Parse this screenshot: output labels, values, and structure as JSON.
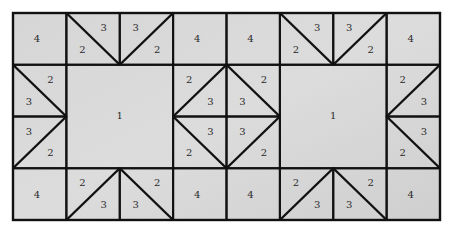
{
  "diagram": {
    "type": "quilt-block-pattern",
    "grid": {
      "columns": 8,
      "rows": 4
    },
    "colors": {
      "fabric": "#d3d3d3",
      "fabric_light": "#dedede",
      "line": "#111111",
      "background": "#ffffff"
    },
    "piece_labels": {
      "large_square": "1",
      "triangle_a": "2",
      "triangle_b": "3",
      "small_square": "4"
    },
    "cells": [
      {
        "row": 0,
        "col": 0,
        "type": "square",
        "labels": [
          {
            "text": "4",
            "pos": "c"
          }
        ]
      },
      {
        "row": 0,
        "col": 1,
        "type": "diag",
        "diag": "tl-br",
        "labels": [
          {
            "text": "3",
            "pos": "tr"
          },
          {
            "text": "2",
            "pos": "bl"
          }
        ]
      },
      {
        "row": 0,
        "col": 2,
        "type": "diag",
        "diag": "bl-tr",
        "labels": [
          {
            "text": "3",
            "pos": "tl"
          },
          {
            "text": "2",
            "pos": "br"
          }
        ]
      },
      {
        "row": 0,
        "col": 3,
        "type": "square",
        "labels": [
          {
            "text": "4",
            "pos": "c"
          }
        ]
      },
      {
        "row": 0,
        "col": 4,
        "type": "square",
        "labels": [
          {
            "text": "4",
            "pos": "c"
          }
        ]
      },
      {
        "row": 0,
        "col": 5,
        "type": "diag",
        "diag": "tl-br",
        "labels": [
          {
            "text": "3",
            "pos": "tr"
          },
          {
            "text": "2",
            "pos": "bl"
          }
        ]
      },
      {
        "row": 0,
        "col": 6,
        "type": "diag",
        "diag": "bl-tr",
        "labels": [
          {
            "text": "3",
            "pos": "tl"
          },
          {
            "text": "2",
            "pos": "br"
          }
        ]
      },
      {
        "row": 0,
        "col": 7,
        "type": "square",
        "labels": [
          {
            "text": "4",
            "pos": "c"
          }
        ]
      },
      {
        "row": 1,
        "col": 0,
        "type": "diag",
        "diag": "tl-br",
        "labels": [
          {
            "text": "2",
            "pos": "tr"
          },
          {
            "text": "3",
            "pos": "bl"
          }
        ]
      },
      {
        "row": 1,
        "col": 3,
        "type": "diag",
        "diag": "bl-tr",
        "labels": [
          {
            "text": "2",
            "pos": "tl"
          },
          {
            "text": "3",
            "pos": "br"
          }
        ]
      },
      {
        "row": 1,
        "col": 4,
        "type": "diag",
        "diag": "tl-br",
        "labels": [
          {
            "text": "3",
            "pos": "bl"
          },
          {
            "text": "2",
            "pos": "tr"
          }
        ]
      },
      {
        "row": 1,
        "col": 7,
        "type": "diag",
        "diag": "bl-tr",
        "labels": [
          {
            "text": "2",
            "pos": "tl"
          },
          {
            "text": "3",
            "pos": "br"
          }
        ]
      },
      {
        "row": 2,
        "col": 0,
        "type": "diag",
        "diag": "bl-tr",
        "labels": [
          {
            "text": "3",
            "pos": "tl"
          },
          {
            "text": "2",
            "pos": "br"
          }
        ]
      },
      {
        "row": 2,
        "col": 3,
        "type": "diag",
        "diag": "tl-br",
        "labels": [
          {
            "text": "3",
            "pos": "tr"
          },
          {
            "text": "2",
            "pos": "bl"
          }
        ]
      },
      {
        "row": 2,
        "col": 4,
        "type": "diag",
        "diag": "bl-tr",
        "labels": [
          {
            "text": "3",
            "pos": "tl"
          },
          {
            "text": "2",
            "pos": "br"
          }
        ]
      },
      {
        "row": 2,
        "col": 7,
        "type": "diag",
        "diag": "tl-br",
        "labels": [
          {
            "text": "3",
            "pos": "tr"
          },
          {
            "text": "2",
            "pos": "bl"
          }
        ]
      },
      {
        "row": 3,
        "col": 0,
        "type": "square",
        "labels": [
          {
            "text": "4",
            "pos": "c"
          }
        ]
      },
      {
        "row": 3,
        "col": 1,
        "type": "diag",
        "diag": "bl-tr",
        "labels": [
          {
            "text": "2",
            "pos": "tl"
          },
          {
            "text": "3",
            "pos": "br"
          }
        ]
      },
      {
        "row": 3,
        "col": 2,
        "type": "diag",
        "diag": "tl-br",
        "labels": [
          {
            "text": "2",
            "pos": "tr"
          },
          {
            "text": "3",
            "pos": "bl"
          }
        ]
      },
      {
        "row": 3,
        "col": 3,
        "type": "square",
        "labels": [
          {
            "text": "4",
            "pos": "c"
          }
        ]
      },
      {
        "row": 3,
        "col": 4,
        "type": "square",
        "labels": [
          {
            "text": "4",
            "pos": "c"
          }
        ]
      },
      {
        "row": 3,
        "col": 5,
        "type": "diag",
        "diag": "bl-tr",
        "labels": [
          {
            "text": "2",
            "pos": "tl"
          },
          {
            "text": "3",
            "pos": "br"
          }
        ]
      },
      {
        "row": 3,
        "col": 6,
        "type": "diag",
        "diag": "tl-br",
        "labels": [
          {
            "text": "2",
            "pos": "tr"
          },
          {
            "text": "3",
            "pos": "bl"
          }
        ]
      },
      {
        "row": 3,
        "col": 7,
        "type": "square",
        "labels": [
          {
            "text": "4",
            "pos": "c"
          }
        ]
      }
    ],
    "large_squares": [
      {
        "row": 1,
        "col": 1,
        "rowspan": 2,
        "colspan": 2,
        "label": "1"
      },
      {
        "row": 1,
        "col": 5,
        "rowspan": 2,
        "colspan": 2,
        "label": "1"
      }
    ]
  }
}
